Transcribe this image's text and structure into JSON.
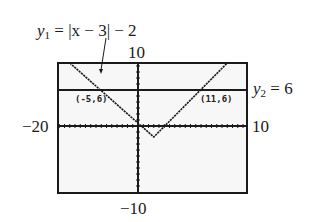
{
  "chart_data": {
    "type": "line",
    "title": "",
    "series": [
      {
        "name": "y1",
        "label_prefix": "y",
        "label_sub": "1",
        "label_rest": " = |x − 3| − 2",
        "expression": "|x - 3| - 2",
        "color": "#1a1a1a",
        "style": "dotted-pixel"
      },
      {
        "name": "y2",
        "label_prefix": "y",
        "label_sub": "2",
        "label_rest": " = 6",
        "expression": "6",
        "color": "#1a1a1a",
        "style": "solid"
      }
    ],
    "intersections": [
      {
        "x": -5,
        "y": 6,
        "label": "(-5,6)"
      },
      {
        "x": 11,
        "y": 6,
        "label": "(11,6)"
      }
    ],
    "window_labels": {
      "xmin": "−20",
      "xmax": "10",
      "ymax": "10",
      "ymin": "−10"
    },
    "axis_ticks": "1 unit spacing",
    "grid": false,
    "legend_position": "annotations",
    "background": "#f7f7f7"
  },
  "labels": {
    "y1_prefix": "y",
    "y1_sub": "1",
    "y1_rest": " = |x − 3| − 2",
    "y2_prefix": "y",
    "y2_sub": "2",
    "y2_rest": " = 6",
    "ymax": "10",
    "ymin": "−10",
    "xmin": "−20",
    "xmax": "10",
    "point_left": "(-5,6)",
    "point_right": "(11,6)"
  }
}
